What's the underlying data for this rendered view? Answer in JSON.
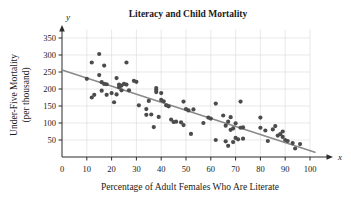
{
  "figure": {
    "width": 351,
    "height": 198,
    "background": "#ffffff"
  },
  "chart_data": {
    "type": "scatter",
    "title": "Literacy and Child Mortality",
    "xlabel": "Percentage of Adult Females Who Are Literate",
    "ylabel": "Under-Five Mortality\n(per thousand)",
    "ylabel_line1": "Under-Five Mortality",
    "ylabel_line2": "(per thousand)",
    "x_axis_symbol": "x",
    "y_axis_symbol": "y",
    "xlim": [
      0,
      100
    ],
    "ylim": [
      0,
      375
    ],
    "xticks": [
      0,
      10,
      20,
      30,
      40,
      50,
      60,
      70,
      80,
      90,
      100
    ],
    "yticks": [
      50,
      100,
      150,
      200,
      250,
      300,
      350
    ],
    "xtick_labels": [
      "0",
      "10",
      "20",
      "30",
      "40",
      "50",
      "60",
      "70",
      "80",
      "90",
      "100"
    ],
    "ytick_labels": [
      "50",
      "100",
      "150",
      "200",
      "250",
      "300",
      "350"
    ],
    "grid": true,
    "grid_color": "#d9d9d9",
    "legend": null,
    "point_color": "#4b4b4b",
    "point_radius": 2.1,
    "trend_color": "#8a8a8a",
    "trendline": {
      "type": "linear",
      "x_start": 0,
      "y_start": 256,
      "x_end": 102,
      "y_end": 14,
      "slope": -2.37,
      "intercept": 256
    },
    "points": [
      [
        10,
        230
      ],
      [
        12,
        278
      ],
      [
        12,
        175
      ],
      [
        13,
        183
      ],
      [
        15,
        303
      ],
      [
        15,
        241
      ],
      [
        16,
        220
      ],
      [
        16,
        195
      ],
      [
        17,
        269
      ],
      [
        17,
        215
      ],
      [
        18,
        214
      ],
      [
        18,
        183
      ],
      [
        20,
        188
      ],
      [
        21,
        161
      ],
      [
        22,
        232
      ],
      [
        22,
        184
      ],
      [
        23,
        205
      ],
      [
        23,
        213
      ],
      [
        24,
        210
      ],
      [
        24,
        196
      ],
      [
        25,
        215
      ],
      [
        26,
        278
      ],
      [
        26,
        213
      ],
      [
        27,
        196
      ],
      [
        29,
        224
      ],
      [
        30,
        221
      ],
      [
        31,
        152
      ],
      [
        34,
        141
      ],
      [
        34,
        124
      ],
      [
        35,
        165
      ],
      [
        36,
        125
      ],
      [
        37,
        88
      ],
      [
        38,
        203
      ],
      [
        38,
        197
      ],
      [
        38,
        191
      ],
      [
        39,
        118
      ],
      [
        40,
        188
      ],
      [
        40,
        168
      ],
      [
        41,
        164
      ],
      [
        42,
        152
      ],
      [
        43,
        149
      ],
      [
        44,
        110
      ],
      [
        45,
        103
      ],
      [
        46,
        104
      ],
      [
        48,
        102
      ],
      [
        49,
        163
      ],
      [
        49,
        94
      ],
      [
        50,
        141
      ],
      [
        51,
        137
      ],
      [
        52,
        68
      ],
      [
        53,
        140
      ],
      [
        57,
        100
      ],
      [
        59,
        116
      ],
      [
        60,
        113
      ],
      [
        62,
        157
      ],
      [
        62,
        50
      ],
      [
        65,
        122
      ],
      [
        66,
        92
      ],
      [
        66,
        46
      ],
      [
        67,
        33
      ],
      [
        67,
        104
      ],
      [
        68,
        117
      ],
      [
        68,
        80
      ],
      [
        69,
        84
      ],
      [
        69,
        44
      ],
      [
        70,
        99
      ],
      [
        70,
        56
      ],
      [
        71,
        52
      ],
      [
        72,
        163
      ],
      [
        72,
        86
      ],
      [
        73,
        54
      ],
      [
        73,
        87
      ],
      [
        80,
        116
      ],
      [
        80,
        86
      ],
      [
        82,
        78
      ],
      [
        83,
        47
      ],
      [
        85,
        81
      ],
      [
        86,
        91
      ],
      [
        87,
        63
      ],
      [
        88,
        67
      ],
      [
        89,
        59
      ],
      [
        89,
        75
      ],
      [
        90,
        50
      ],
      [
        91,
        47
      ],
      [
        93,
        41
      ],
      [
        94,
        25
      ],
      [
        96,
        38
      ]
    ]
  },
  "point_count": 87
}
